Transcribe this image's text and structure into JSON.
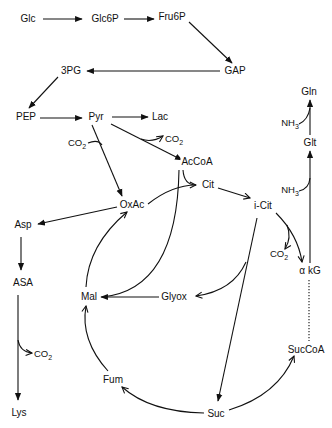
{
  "diagram": {
    "nodes": {
      "glc": "Glc",
      "glc6p": "Glc6P",
      "fru6p": "Fru6P",
      "gap": "GAP",
      "pg3": "3PG",
      "pep": "PEP",
      "pyr": "Pyr",
      "lac": "Lac",
      "accoa": "AcCoA",
      "oxac": "OxAc",
      "cit": "Cit",
      "icit": "i-Cit",
      "akg": "α kG",
      "succoa": "SucCoA",
      "suc": "Suc",
      "fum": "Fum",
      "mal": "Mal",
      "glyox": "Glyox",
      "asp": "Asp",
      "asa": "ASA",
      "lys": "Lys",
      "glt": "Glt",
      "gln": "Gln"
    },
    "cofactors": {
      "co2_main": "CO",
      "co2_sub": "2",
      "nh3_main": "NH",
      "nh3_sub": "3"
    },
    "edges": [
      [
        "Glc",
        "Glc6P"
      ],
      [
        "Glc6P",
        "Fru6P"
      ],
      [
        "Fru6P",
        "GAP"
      ],
      [
        "GAP",
        "3PG"
      ],
      [
        "3PG",
        "PEP"
      ],
      [
        "PEP",
        "Pyr"
      ],
      [
        "Pyr",
        "Lac"
      ],
      [
        "Pyr",
        "AcCoA",
        "releases CO2"
      ],
      [
        "Pyr",
        "OxAc",
        "consumes CO2"
      ],
      [
        "AcCoA",
        "Cit"
      ],
      [
        "OxAc",
        "Cit"
      ],
      [
        "Cit",
        "i-Cit"
      ],
      [
        "i-Cit",
        "α kG",
        "releases CO2"
      ],
      [
        "α kG",
        "SucCoA",
        "dotted"
      ],
      [
        "SucCoA",
        "Suc"
      ],
      [
        "Suc",
        "Fum"
      ],
      [
        "Fum",
        "Mal"
      ],
      [
        "Mal",
        "OxAc"
      ],
      [
        "i-Cit",
        "Suc"
      ],
      [
        "i-Cit",
        "Glyox"
      ],
      [
        "Glyox",
        "Mal"
      ],
      [
        "AcCoA",
        "Mal"
      ],
      [
        "OxAc",
        "Asp"
      ],
      [
        "Asp",
        "ASA"
      ],
      [
        "ASA",
        "Lys",
        "releases CO2"
      ],
      [
        "α kG",
        "Glt",
        "consumes NH3"
      ],
      [
        "Glt",
        "Gln",
        "consumes NH3"
      ]
    ]
  }
}
